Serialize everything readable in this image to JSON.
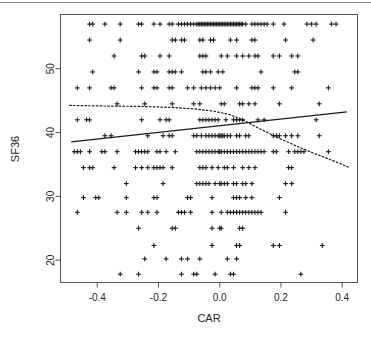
{
  "figure": {
    "background": "#ffffff",
    "plot_border_color": "#555555",
    "ink_color": "#1a1a1a",
    "top_rule_color": "#8d8d8d"
  },
  "chart_data": {
    "type": "scatter",
    "title": "",
    "xlabel": "CAR",
    "ylabel": "SF36",
    "xlim": [
      -0.52,
      0.45
    ],
    "ylim": [
      16.5,
      58.5
    ],
    "xticks": [
      -0.4,
      -0.2,
      0.0,
      0.2,
      0.4
    ],
    "xtick_labels": [
      "-0.4",
      "-0.2",
      "0.0",
      "0.2",
      "0.4"
    ],
    "yticks": [
      20,
      30,
      40,
      50
    ],
    "ytick_labels": [
      "20",
      "30",
      "40",
      "50"
    ],
    "grid": false,
    "legend": null,
    "marker": "plus",
    "marker_color": "#1a1a1a",
    "series": [
      {
        "name": "observations",
        "x": [
          -0.425,
          -0.415,
          -0.375,
          -0.335,
          -0.325,
          -0.285,
          -0.275,
          -0.245,
          -0.235,
          -0.225,
          -0.205,
          -0.195,
          -0.185,
          -0.175,
          -0.165,
          -0.155,
          -0.145,
          -0.135,
          -0.125,
          -0.115,
          -0.105,
          -0.1,
          -0.095,
          -0.09,
          -0.085,
          -0.08,
          -0.075,
          -0.07,
          -0.065,
          -0.06,
          -0.055,
          -0.05,
          -0.045,
          -0.04,
          -0.035,
          -0.03,
          -0.025,
          -0.02,
          -0.015,
          -0.01,
          -0.005,
          0.0,
          0.005,
          0.01,
          0.015,
          0.02,
          0.025,
          0.03,
          0.035,
          0.04,
          0.045,
          0.05,
          0.06,
          0.07,
          0.08,
          0.095,
          0.105,
          0.115,
          0.125,
          0.135,
          0.145,
          0.155,
          0.175,
          0.195,
          0.215,
          0.275,
          0.285,
          0.305,
          0.355,
          0.365
        ],
        "y": [
          57,
          57,
          57,
          57,
          57,
          57,
          57,
          57,
          57,
          57,
          57,
          57,
          57,
          57,
          57,
          57,
          57,
          57,
          57,
          57,
          57,
          57,
          57,
          57,
          57,
          57,
          57,
          57,
          57,
          57,
          57,
          57,
          57,
          57,
          57,
          57,
          57,
          57,
          57,
          57,
          57,
          57,
          57,
          57,
          57,
          57,
          57,
          57,
          57,
          57,
          57,
          57,
          57,
          57,
          57,
          57,
          57,
          57,
          57,
          57,
          57,
          57,
          57,
          57,
          57,
          57,
          57,
          57,
          57,
          57
        ]
      }
    ],
    "bands": [
      {
        "value": 57,
        "x": [
          -0.425,
          -0.415,
          -0.375,
          -0.325,
          -0.265,
          -0.255,
          -0.215,
          -0.195,
          -0.165,
          -0.155,
          -0.135,
          -0.125,
          -0.115,
          -0.105,
          -0.095,
          -0.085,
          -0.075,
          -0.07,
          -0.065,
          -0.06,
          -0.055,
          -0.05,
          -0.045,
          -0.04,
          -0.035,
          -0.03,
          -0.025,
          -0.02,
          -0.015,
          -0.01,
          -0.005,
          0.0,
          0.005,
          0.01,
          0.015,
          0.02,
          0.025,
          0.03,
          0.035,
          0.04,
          0.045,
          0.05,
          0.055,
          0.06,
          0.065,
          0.07,
          0.075,
          0.085,
          0.105,
          0.115,
          0.125,
          0.135,
          0.145,
          0.155,
          0.175,
          0.21,
          0.285,
          0.3,
          0.315,
          0.365,
          0.38
        ]
      },
      {
        "value": 54.5,
        "x": [
          -0.425,
          -0.325,
          -0.155,
          -0.145,
          -0.125,
          -0.115,
          -0.065,
          -0.055,
          -0.03,
          -0.02,
          0.035,
          0.055,
          0.105,
          0.115,
          0.215,
          0.305
        ]
      },
      {
        "value": 52,
        "x": [
          -0.345,
          -0.255,
          -0.245,
          -0.195,
          -0.165,
          -0.065,
          -0.055,
          -0.045,
          0.005,
          0.025,
          0.055,
          0.075,
          0.095,
          0.115,
          0.125,
          0.175,
          0.195,
          0.235,
          0.255
        ]
      },
      {
        "value": 49.5,
        "x": [
          -0.415,
          -0.265,
          -0.215,
          -0.205,
          -0.165,
          -0.155,
          -0.145,
          -0.125,
          -0.055,
          -0.045,
          -0.03,
          -0.005,
          0.01,
          0.135,
          0.245,
          0.255
        ]
      },
      {
        "value": 47,
        "x": [
          -0.465,
          -0.425,
          -0.355,
          -0.345,
          -0.255,
          -0.215,
          -0.205,
          -0.165,
          -0.155,
          -0.105,
          -0.085,
          -0.06,
          -0.045,
          -0.03,
          -0.015,
          0.0,
          0.055,
          0.105,
          0.115,
          0.125,
          0.175,
          0.235,
          0.355
        ]
      },
      {
        "value": 44.5,
        "x": [
          -0.335,
          -0.245,
          -0.155,
          -0.085,
          -0.065,
          0.005,
          0.015,
          0.065,
          0.075,
          0.095,
          0.115,
          0.195,
          0.325
        ]
      },
      {
        "value": 42,
        "x": [
          -0.465,
          -0.435,
          -0.425,
          -0.255,
          -0.195,
          -0.175,
          -0.165,
          -0.065,
          -0.055,
          -0.045,
          -0.035,
          -0.025,
          -0.015,
          -0.005,
          0.02,
          0.045,
          0.055,
          0.065,
          0.075,
          0.125,
          0.145,
          0.315
        ]
      },
      {
        "value": 39.5,
        "x": [
          -0.375,
          -0.355,
          -0.235,
          -0.185,
          -0.165,
          -0.155,
          -0.085,
          -0.075,
          -0.06,
          -0.045,
          -0.035,
          -0.025,
          -0.015,
          -0.005,
          0.0,
          0.005,
          0.01,
          0.015,
          0.025,
          0.035,
          0.055,
          0.065,
          0.085,
          0.095,
          0.175,
          0.185,
          0.195,
          0.215,
          0.235,
          0.255,
          0.325
        ]
      },
      {
        "value": 37,
        "x": [
          -0.475,
          -0.465,
          -0.455,
          -0.425,
          -0.385,
          -0.375,
          -0.335,
          -0.275,
          -0.265,
          -0.255,
          -0.245,
          -0.235,
          -0.205,
          -0.195,
          -0.175,
          -0.145,
          -0.075,
          -0.065,
          -0.055,
          -0.045,
          -0.035,
          -0.025,
          -0.015,
          -0.005,
          0.0,
          0.005,
          0.015,
          0.025,
          0.035,
          0.045,
          0.055,
          0.065,
          0.075,
          0.085,
          0.095,
          0.105,
          0.115,
          0.125,
          0.135,
          0.145,
          0.175,
          0.185,
          0.225,
          0.245,
          0.255,
          0.265,
          0.275,
          0.355
        ]
      },
      {
        "value": 34.5,
        "x": [
          -0.445,
          -0.425,
          -0.415,
          -0.345,
          -0.275,
          -0.255,
          -0.235,
          -0.215,
          -0.205,
          -0.195,
          -0.185,
          -0.155,
          -0.065,
          -0.055,
          -0.045,
          -0.025,
          -0.005,
          0.015,
          0.025,
          0.045,
          0.075,
          0.095,
          0.115,
          0.225,
          0.235
        ]
      },
      {
        "value": 32,
        "x": [
          -0.305,
          -0.185,
          -0.075,
          -0.065,
          -0.055,
          -0.045,
          -0.035,
          -0.015,
          0.0,
          0.005,
          0.015,
          0.025,
          0.045,
          0.055,
          0.075,
          0.085,
          0.105,
          0.215,
          0.235
        ]
      },
      {
        "value": 29.8,
        "x": [
          -0.445,
          -0.405,
          -0.395,
          -0.305,
          -0.215,
          -0.205,
          -0.105,
          -0.095,
          -0.025,
          0.045,
          0.055,
          0.065,
          0.085,
          0.105,
          0.195
        ]
      },
      {
        "value": 27.5,
        "x": [
          -0.465,
          -0.335,
          -0.305,
          -0.255,
          -0.235,
          -0.205,
          -0.135,
          -0.125,
          -0.115,
          -0.095,
          -0.025,
          0.005,
          0.025,
          0.035,
          0.045,
          0.055,
          0.065,
          0.075,
          0.085,
          0.095,
          0.105,
          0.115,
          0.125,
          0.135,
          0.215
        ]
      },
      {
        "value": 25,
        "x": [
          -0.265,
          -0.155,
          -0.145,
          -0.025,
          0.0,
          0.005,
          0.065,
          0.075
        ]
      },
      {
        "value": 22.3,
        "x": [
          -0.215,
          -0.025,
          0.055,
          0.065,
          0.175,
          0.195,
          0.335
        ]
      },
      {
        "value": 20.2,
        "x": [
          -0.245,
          -0.175,
          -0.125,
          -0.105,
          -0.065,
          0.025,
          0.055
        ]
      },
      {
        "value": 17.8,
        "x": [
          -0.325,
          -0.265,
          -0.125,
          -0.085,
          -0.075,
          -0.015,
          0.035,
          0.045,
          0.265
        ]
      }
    ],
    "lines": [
      {
        "name": "linear-fit",
        "style": "solid",
        "color": "#1a1a1a",
        "points": [
          [
            -0.485,
            38.55
          ],
          [
            0.415,
            43.25
          ]
        ]
      },
      {
        "name": "smoother-fit",
        "style": "dotted",
        "color": "#1a1a1a",
        "points": [
          [
            -0.49,
            44.25
          ],
          [
            -0.36,
            44.15
          ],
          [
            -0.26,
            44.1
          ],
          [
            -0.16,
            43.95
          ],
          [
            -0.08,
            43.7
          ],
          [
            -0.02,
            43.35
          ],
          [
            0.03,
            42.85
          ],
          [
            0.08,
            41.9
          ],
          [
            0.13,
            40.6
          ],
          [
            0.19,
            39.2
          ],
          [
            0.25,
            37.9
          ],
          [
            0.31,
            36.7
          ],
          [
            0.37,
            35.6
          ],
          [
            0.425,
            34.5
          ]
        ]
      }
    ]
  }
}
